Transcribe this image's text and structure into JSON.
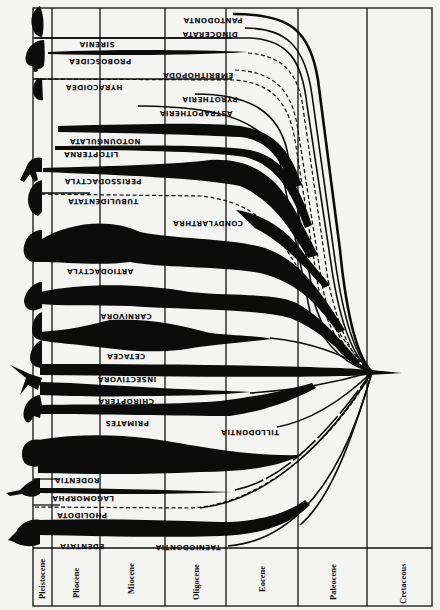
{
  "diagram": {
    "type": "phylogenetic-spindle-diagram",
    "orientation": "rotated: time axis horizontal (recent at left, oldest at right), order labels printed upside down",
    "periods": [
      {
        "name": "Pleistocene",
        "x0": 33,
        "x1": 52
      },
      {
        "name": "Pliocene",
        "x0": 52,
        "x1": 100
      },
      {
        "name": "Miocene",
        "x0": 100,
        "x1": 165
      },
      {
        "name": "Oligocene",
        "x0": 165,
        "x1": 226
      },
      {
        "name": "Eocene",
        "x0": 226,
        "x1": 298
      },
      {
        "name": "Paleocene",
        "x0": 298,
        "x1": 367
      },
      {
        "name": "Cretaceous",
        "x0": 367,
        "x1": 432
      }
    ],
    "orders": [
      {
        "name": "PANTODONTA",
        "status": "extinct"
      },
      {
        "name": "DINOCERATA",
        "status": "extinct"
      },
      {
        "name": "SIRENIA",
        "status": "living"
      },
      {
        "name": "PROBOSCIDEA",
        "status": "living"
      },
      {
        "name": "EMBRITHOPODA",
        "status": "extinct"
      },
      {
        "name": "HYRACOIDEA",
        "status": "living"
      },
      {
        "name": "PYROTHERIA",
        "status": "extinct"
      },
      {
        "name": "ASTRAPOTHERIA",
        "status": "extinct"
      },
      {
        "name": "NOTOUNGULATA",
        "status": "extinct"
      },
      {
        "name": "LITOPTERNA",
        "status": "extinct"
      },
      {
        "name": "PERISSODACTYLA",
        "status": "living"
      },
      {
        "name": "TUBULIDENTATA",
        "status": "living"
      },
      {
        "name": "CONDYLARTHRA",
        "status": "extinct"
      },
      {
        "name": "ARTIODACTYLA",
        "status": "living"
      },
      {
        "name": "CARNIVORA",
        "status": "living"
      },
      {
        "name": "CETACEA",
        "status": "living"
      },
      {
        "name": "INSECTIVORA",
        "status": "living"
      },
      {
        "name": "CHIROPTERA",
        "status": "living"
      },
      {
        "name": "PRIMATES",
        "status": "living"
      },
      {
        "name": "TILLODONTIA",
        "status": "extinct"
      },
      {
        "name": "RODENTIA",
        "status": "living"
      },
      {
        "name": "LAGOMORPHA",
        "status": "living"
      },
      {
        "name": "PHOLIDOTA",
        "status": "living"
      },
      {
        "name": "EDENTATA",
        "status": "living"
      },
      {
        "name": "TAENIODONTIA",
        "status": "extinct"
      }
    ],
    "silhouettes": [
      "sea-cow-silhouette",
      "elephant-silhouette",
      "hyrax-silhouette",
      "horse-silhouette",
      "aardvark-silhouette",
      "bison-silhouette",
      "bear-silhouette",
      "whale-silhouette",
      "shrew-silhouette",
      "bat-silhouette",
      "monkey-silhouette",
      "gorilla-silhouette",
      "rabbit-silhouette",
      "armadillo-silhouette"
    ]
  }
}
